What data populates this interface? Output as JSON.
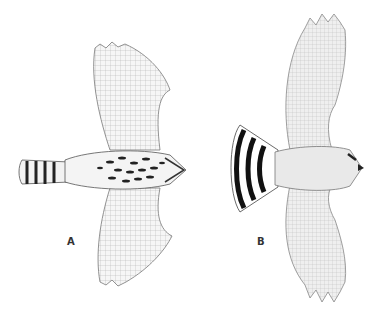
{
  "figure": {
    "birds": [
      {
        "id": "A",
        "label": "A",
        "tail": "narrow, banded with dark bars",
        "body": "heavily streaked breast"
      },
      {
        "id": "B",
        "label": "B",
        "tail": "fanned, broad black and white bands",
        "body": "pale, lightly marked"
      }
    ],
    "colors": {
      "background": "#ffffff",
      "ink": "#333333",
      "dark_band": "#111111",
      "wash": "#e8e8e8"
    }
  }
}
